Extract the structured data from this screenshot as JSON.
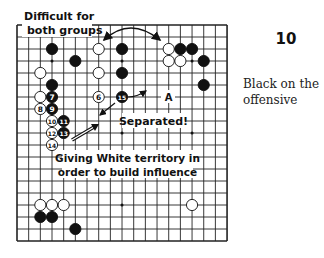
{
  "diagram": {
    "number": "10",
    "caption_lines": [
      "Black on the",
      "offensive"
    ]
  },
  "board": {
    "size": 19,
    "origin_x": 17,
    "origin_y": 25,
    "step_x": 11.67,
    "step_y": 12,
    "line_color": "#222222",
    "star_points": [
      [
        3,
        3
      ],
      [
        9,
        3
      ],
      [
        15,
        3
      ],
      [
        3,
        9
      ],
      [
        9,
        9
      ],
      [
        15,
        9
      ],
      [
        3,
        15
      ],
      [
        9,
        15
      ],
      [
        15,
        15
      ]
    ],
    "stones": [
      {
        "color": "black",
        "col": 3,
        "row": 2
      },
      {
        "color": "white",
        "col": 7,
        "row": 2
      },
      {
        "color": "black",
        "col": 9,
        "row": 2
      },
      {
        "color": "white",
        "col": 13,
        "row": 2
      },
      {
        "color": "black",
        "col": 14,
        "row": 2
      },
      {
        "color": "black",
        "col": 15,
        "row": 2
      },
      {
        "color": "black",
        "col": 5,
        "row": 3
      },
      {
        "color": "white",
        "col": 13,
        "row": 3
      },
      {
        "color": "white",
        "col": 14,
        "row": 3
      },
      {
        "color": "black",
        "col": 16,
        "row": 3
      },
      {
        "color": "white",
        "col": 2,
        "row": 4
      },
      {
        "color": "white",
        "col": 7,
        "row": 4
      },
      {
        "color": "black",
        "col": 9,
        "row": 4
      },
      {
        "color": "black",
        "col": 3,
        "row": 5
      },
      {
        "color": "black",
        "col": 16,
        "row": 5
      },
      {
        "color": "white",
        "col": 2,
        "row": 6
      },
      {
        "color": "black",
        "col": 3,
        "row": 6,
        "label": "7"
      },
      {
        "color": "white",
        "col": 7,
        "row": 6,
        "label": "6"
      },
      {
        "color": "black",
        "col": 9,
        "row": 6,
        "label": "15"
      },
      {
        "color": "white",
        "col": 2,
        "row": 7,
        "label": "8"
      },
      {
        "color": "black",
        "col": 3,
        "row": 7,
        "label": "9"
      },
      {
        "color": "white",
        "col": 3,
        "row": 8,
        "label": "10"
      },
      {
        "color": "black",
        "col": 4,
        "row": 8,
        "label": "11"
      },
      {
        "color": "white",
        "col": 3,
        "row": 9,
        "label": "12"
      },
      {
        "color": "black",
        "col": 4,
        "row": 9,
        "label": "13"
      },
      {
        "color": "white",
        "col": 3,
        "row": 10,
        "label": "14"
      },
      {
        "color": "white",
        "col": 2,
        "row": 15
      },
      {
        "color": "white",
        "col": 3,
        "row": 15
      },
      {
        "color": "white",
        "col": 4,
        "row": 15
      },
      {
        "color": "white",
        "col": 15,
        "row": 15
      },
      {
        "color": "black",
        "col": 2,
        "row": 16
      },
      {
        "color": "black",
        "col": 3,
        "row": 16
      },
      {
        "color": "black",
        "col": 5,
        "row": 17
      }
    ],
    "point_labels": [
      {
        "text": "A",
        "col": 13,
        "row": 6
      }
    ]
  },
  "annotations": {
    "difficult": {
      "lines": [
        "Difficult for",
        "both groups"
      ]
    },
    "separated": {
      "text": "Separated!"
    },
    "giving": {
      "lines": [
        "Giving White territory in",
        "order to build influence"
      ]
    }
  }
}
